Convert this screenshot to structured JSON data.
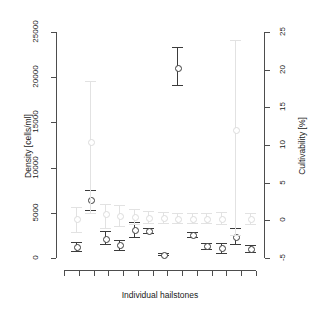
{
  "chart_data": {
    "type": "scatter",
    "title": "",
    "xlabel": "Individual hailstones",
    "ylabel": "Density [cells/ml]",
    "y2label": "Cultivability [%]",
    "ylim": [
      0,
      25000
    ],
    "yticks": [
      "0",
      "5000",
      "10000",
      "15000",
      "20000",
      "25000"
    ],
    "ytick_values": [
      0,
      5000,
      10000,
      15000,
      20000,
      25000
    ],
    "y2lim": [
      -5,
      25
    ],
    "y2ticks": [
      "-5",
      "0",
      "5",
      "10",
      "15",
      "20",
      "25"
    ],
    "y2tick_values": [
      -5,
      0,
      5,
      10,
      15,
      20,
      25
    ],
    "grid": false,
    "legend": "none",
    "x_tick_count": 14,
    "x_tick_labels": [],
    "series": [
      {
        "name": "Density [cells/ml]",
        "color": "#3b3b3b",
        "axis": "left",
        "x": [
          1,
          2,
          3,
          4,
          5,
          6,
          7,
          8,
          9,
          10,
          11,
          12,
          13
        ],
        "values": [
          1300,
          6500,
          2200,
          1500,
          3200,
          3050,
          400,
          21100,
          2600,
          1350,
          1150,
          2400,
          1000
        ],
        "err_low": [
          800,
          5300,
          1500,
          900,
          2300,
          2800,
          300,
          19100,
          2300,
          1050,
          600,
          1500,
          650
        ],
        "err_high": [
          1800,
          7500,
          3000,
          2000,
          4000,
          3300,
          500,
          23300,
          2900,
          1700,
          1650,
          3300,
          1400
        ]
      },
      {
        "name": "Cultivability [%]",
        "color": "#e2e2e2",
        "axis": "right",
        "x": [
          1,
          2,
          3,
          4,
          5,
          6,
          7,
          8,
          9,
          10,
          11,
          12,
          13
        ],
        "values": [
          0.3,
          10.5,
          0.9,
          0.6,
          0.5,
          0.4,
          0.4,
          0.3,
          0.3,
          0.3,
          0.3,
          12.0,
          0.3
        ],
        "err_low": [
          -1.5,
          1.0,
          -1.0,
          -0.8,
          -0.5,
          -0.4,
          -0.4,
          -0.3,
          -0.4,
          -0.4,
          -0.5,
          -2.0,
          -0.5
        ],
        "err_high": [
          1.8,
          18.5,
          2.2,
          2.0,
          1.5,
          1.2,
          1.1,
          1.0,
          1.0,
          1.0,
          1.1,
          24.0,
          1.0
        ]
      }
    ]
  },
  "axes": {
    "left_title": "Density [cells/ml]",
    "right_title": "Cultivability [%]",
    "bottom_title": "Individual hailstones"
  }
}
